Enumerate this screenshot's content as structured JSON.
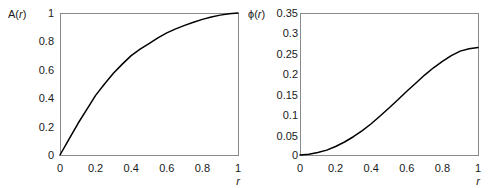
{
  "figure": {
    "background_color": "#ffffff",
    "curve_color": "#000000",
    "frame_color": "#8a8a8a",
    "text_color": "#1a1a1a"
  },
  "chart_data": [
    {
      "type": "line",
      "title": "",
      "panel": "left",
      "ylabel": "A(r)",
      "xlabel": "r",
      "xlim": [
        0,
        1
      ],
      "ylim": [
        0,
        1
      ],
      "grid": false,
      "legend": false,
      "xticks": [
        "0",
        "0.2",
        "0.4",
        "0.6",
        "0.8",
        "1"
      ],
      "xtick_values": [
        0,
        0.2,
        0.4,
        0.6,
        0.8,
        1
      ],
      "yticks": [
        "0",
        "0.2",
        "0.4",
        "0.6",
        "0.8",
        "1"
      ],
      "ytick_values": [
        0,
        0.2,
        0.4,
        0.6,
        0.8,
        1
      ],
      "x": [
        0,
        0.05,
        0.1,
        0.15,
        0.2,
        0.25,
        0.3,
        0.35,
        0.4,
        0.45,
        0.5,
        0.55,
        0.6,
        0.65,
        0.7,
        0.75,
        0.8,
        0.85,
        0.9,
        0.95,
        1
      ],
      "values": [
        0,
        0.11,
        0.22,
        0.32,
        0.42,
        0.5,
        0.575,
        0.64,
        0.7,
        0.745,
        0.785,
        0.825,
        0.86,
        0.888,
        0.913,
        0.935,
        0.955,
        0.972,
        0.985,
        0.995,
        1
      ]
    },
    {
      "type": "line",
      "title": "",
      "panel": "right",
      "ylabel": "ϕ(r)",
      "xlabel": "r",
      "xlim": [
        0,
        1
      ],
      "ylim": [
        0,
        0.35
      ],
      "grid": false,
      "legend": false,
      "xticks": [
        "0",
        "0.2",
        "0.4",
        "0.6",
        "0.8",
        "1"
      ],
      "xtick_values": [
        0,
        0.2,
        0.4,
        0.6,
        0.8,
        1
      ],
      "yticks": [
        "0",
        "0.05",
        "0.1",
        "0.15",
        "0.2",
        "0.25",
        "0.3",
        "0.35"
      ],
      "ytick_values": [
        0,
        0.05,
        0.1,
        0.15,
        0.2,
        0.25,
        0.3,
        0.35
      ],
      "x": [
        0,
        0.05,
        0.1,
        0.15,
        0.2,
        0.25,
        0.3,
        0.35,
        0.4,
        0.45,
        0.5,
        0.55,
        0.6,
        0.65,
        0.7,
        0.75,
        0.8,
        0.85,
        0.9,
        0.95,
        1
      ],
      "values": [
        0,
        0.002,
        0.006,
        0.012,
        0.021,
        0.032,
        0.045,
        0.06,
        0.077,
        0.096,
        0.116,
        0.136,
        0.157,
        0.177,
        0.197,
        0.215,
        0.231,
        0.245,
        0.256,
        0.262,
        0.265
      ]
    }
  ]
}
